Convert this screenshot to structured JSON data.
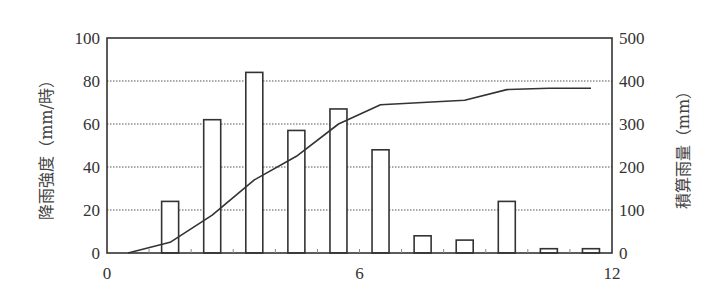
{
  "chart_data": {
    "type": "bar+line",
    "title": "",
    "xlabel": "",
    "x_ticks": [
      "0",
      "6",
      "12"
    ],
    "xlim": [
      0,
      12
    ],
    "grid": "horizontal dotted",
    "left_axis": {
      "label": "降雨強度（mm/時）",
      "ylim": [
        0,
        100
      ],
      "ticks": [
        "0",
        "20",
        "40",
        "60",
        "80",
        "100"
      ]
    },
    "right_axis": {
      "label": "積算雨量（mm）",
      "ylim": [
        0,
        500
      ],
      "ticks": [
        "0",
        "100",
        "200",
        "300",
        "400",
        "500"
      ]
    },
    "series": [
      {
        "name": "降雨強度",
        "type": "bar",
        "axis": "left",
        "x": [
          1.5,
          2.5,
          3.5,
          4.5,
          5.5,
          6.5,
          7.5,
          8.5,
          9.5,
          10.5,
          11.5
        ],
        "values": [
          24,
          62,
          84,
          57,
          67,
          48,
          8,
          6,
          24,
          2,
          2
        ]
      },
      {
        "name": "積算雨量",
        "type": "line",
        "axis": "right",
        "x": [
          0.5,
          1.5,
          2.5,
          3.5,
          4.5,
          5.5,
          6.5,
          7.5,
          8.5,
          9.5,
          10.5,
          11.5
        ],
        "values": [
          0,
          25,
          88,
          170,
          225,
          300,
          345,
          350,
          355,
          380,
          383,
          383
        ]
      }
    ]
  },
  "colors": {
    "axis": "#333333",
    "grid": "#555555",
    "bar_fill": "#ffffff",
    "bar_stroke": "#333333",
    "line": "#333333"
  }
}
